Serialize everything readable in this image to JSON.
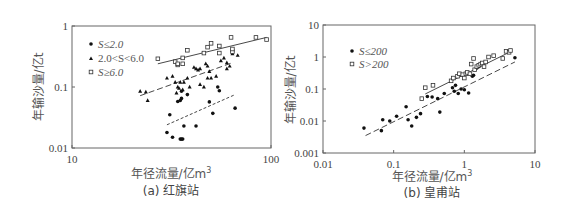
{
  "chart_data": [
    {
      "type": "scatter",
      "title": "(a) 红旗站",
      "xlabel": "年径流量/亿m³",
      "ylabel": "年输沙量/亿t",
      "xscale": "log",
      "yscale": "log",
      "xlim": [
        10,
        100
      ],
      "ylim": [
        0.01,
        1
      ],
      "xticks": [
        "10",
        "100"
      ],
      "yticks": [
        "0.01",
        "0.1",
        "1"
      ],
      "legend_position": "upper-left",
      "grid": false,
      "series": [
        {
          "name": "S≤2.0",
          "marker": "filled-circle",
          "fit_line": "dotted",
          "points": [
            [
              30,
              0.018
            ],
            [
              31,
              0.035
            ],
            [
              32,
              0.015
            ],
            [
              35,
              0.014
            ],
            [
              35.5,
              0.014
            ],
            [
              36,
              0.014
            ],
            [
              36.5,
              0.023
            ],
            [
              42,
              0.023
            ],
            [
              49,
              0.057
            ],
            [
              51,
              0.037
            ],
            [
              54,
              0.1
            ],
            [
              55,
              0.087
            ],
            [
              66,
              0.045
            ],
            [
              38,
              0.075
            ],
            [
              34,
              0.058
            ],
            [
              35,
              0.06
            ],
            [
              35.5,
              0.065
            ],
            [
              35.5,
              0.085
            ]
          ],
          "fit": [
            [
              30,
              0.024
            ],
            [
              66,
              0.075
            ]
          ]
        },
        {
          "name": "2.0<S<6.0",
          "marker": "filled-triangle",
          "fit_line": "dashed",
          "points": [
            [
              22,
              0.085
            ],
            [
              23.5,
              0.083
            ],
            [
              24,
              0.06
            ],
            [
              30,
              0.14
            ],
            [
              32,
              0.15
            ],
            [
              33,
              0.12
            ],
            [
              33.5,
              0.08
            ],
            [
              34,
              0.1
            ],
            [
              34.5,
              0.095
            ],
            [
              35,
              0.12
            ],
            [
              36,
              0.09
            ],
            [
              36.5,
              0.12
            ],
            [
              38,
              0.14
            ],
            [
              39,
              0.1
            ],
            [
              41,
              0.21
            ],
            [
              42,
              0.2
            ],
            [
              43,
              0.19
            ],
            [
              44,
              0.11
            ],
            [
              44,
              0.2
            ],
            [
              46,
              0.1
            ],
            [
              47,
              0.24
            ],
            [
              48,
              0.14
            ],
            [
              48,
              0.22
            ],
            [
              49,
              0.18
            ],
            [
              50,
              0.14
            ],
            [
              53,
              0.15
            ],
            [
              56,
              0.27
            ],
            [
              58,
              0.3
            ],
            [
              60,
              0.25
            ],
            [
              60,
              0.2
            ],
            [
              62,
              0.22
            ],
            [
              64,
              0.35
            ],
            [
              64,
              0.4
            ],
            [
              68,
              0.33
            ]
          ],
          "fit": [
            [
              22,
              0.072
            ],
            [
              64,
              0.25
            ]
          ]
        },
        {
          "name": "S≥6.0",
          "marker": "open-square",
          "fit_line": "solid",
          "points": [
            [
              27,
              0.29
            ],
            [
              33,
              0.26
            ],
            [
              34,
              0.23
            ],
            [
              34,
              0.24
            ],
            [
              36,
              0.3
            ],
            [
              36,
              0.24
            ],
            [
              38,
              0.4
            ],
            [
              46,
              0.36
            ],
            [
              48,
              0.45
            ],
            [
              50,
              0.52
            ],
            [
              55,
              0.36
            ],
            [
              55,
              0.47
            ],
            [
              63,
              0.65
            ],
            [
              64,
              0.38
            ],
            [
              64,
              0.42
            ],
            [
              84,
              0.65
            ],
            [
              95,
              0.6
            ]
          ],
          "fit": [
            [
              27,
              0.24
            ],
            [
              95,
              0.65
            ]
          ]
        }
      ]
    },
    {
      "type": "scatter",
      "title": "(b) 皇甫站",
      "xlabel": "年径流量/亿m³",
      "ylabel": "年输沙量/亿t",
      "xscale": "log",
      "yscale": "log",
      "xlim": [
        0.01,
        10
      ],
      "ylim": [
        0.001,
        10
      ],
      "xticks": [
        "0.01",
        "0.1",
        "1",
        "10"
      ],
      "yticks": [
        "0.001",
        "0.01",
        "0.1",
        "1",
        "10"
      ],
      "legend_position": "upper-left",
      "grid": false,
      "series": [
        {
          "name": "S≤200",
          "marker": "filled-circle",
          "fit_line": "dashed",
          "points": [
            [
              0.038,
              0.006
            ],
            [
              0.067,
              0.005
            ],
            [
              0.07,
              0.011
            ],
            [
              0.088,
              0.01
            ],
            [
              0.11,
              0.014
            ],
            [
              0.15,
              0.028
            ],
            [
              0.16,
              0.011
            ],
            [
              0.18,
              0.007
            ],
            [
              0.21,
              0.013
            ],
            [
              0.24,
              0.017
            ],
            [
              0.3,
              0.058
            ],
            [
              0.35,
              0.056
            ],
            [
              0.42,
              0.05
            ],
            [
              0.45,
              0.019
            ],
            [
              0.52,
              0.072
            ],
            [
              0.68,
              0.11
            ],
            [
              0.72,
              0.085
            ],
            [
              0.75,
              0.13
            ],
            [
              0.82,
              0.072
            ],
            [
              0.9,
              0.1
            ],
            [
              1.0,
              0.095
            ],
            [
              1.15,
              0.075
            ],
            [
              1.3,
              0.25
            ],
            [
              1.35,
              0.27
            ],
            [
              1.5,
              0.45
            ],
            [
              1.6,
              0.5
            ],
            [
              1.8,
              0.6
            ],
            [
              5.2,
              0.95
            ]
          ],
          "fit": [
            [
              0.04,
              0.0035
            ],
            [
              5.2,
              0.7
            ]
          ]
        },
        {
          "name": "S>200",
          "marker": "open-square",
          "fit_line": "solid",
          "points": [
            [
              0.25,
              0.05
            ],
            [
              0.28,
              0.11
            ],
            [
              0.36,
              0.13
            ],
            [
              0.65,
              0.18
            ],
            [
              0.7,
              0.22
            ],
            [
              0.8,
              0.25
            ],
            [
              0.85,
              0.3
            ],
            [
              0.95,
              0.28
            ],
            [
              1.0,
              0.22
            ],
            [
              1.05,
              0.3
            ],
            [
              1.1,
              0.33
            ],
            [
              1.2,
              0.3
            ],
            [
              1.25,
              0.6
            ],
            [
              1.35,
              0.9
            ],
            [
              1.4,
              0.4
            ],
            [
              1.5,
              0.5
            ],
            [
              1.6,
              0.55
            ],
            [
              1.7,
              0.6
            ],
            [
              1.8,
              0.65
            ],
            [
              1.9,
              0.5
            ],
            [
              2.0,
              0.7
            ],
            [
              2.2,
              1.0
            ],
            [
              2.6,
              1.1
            ],
            [
              3.5,
              0.9
            ],
            [
              3.9,
              1.5
            ],
            [
              4.3,
              1.4
            ],
            [
              4.5,
              1.6
            ]
          ],
          "fit": [
            [
              0.28,
              0.07
            ],
            [
              4.6,
              1.5
            ]
          ]
        }
      ]
    }
  ],
  "charts": {
    "a": {
      "ylabel": "年输沙量/亿t",
      "xlabel": "年径流量/亿m",
      "xlabel_sup": "3",
      "caption": "(a) 红旗站",
      "legend": [
        "S≤2.0",
        "2.0<S<6.0",
        "S≥6.0"
      ]
    },
    "b": {
      "ylabel": "年输沙量/亿t",
      "xlabel": "年径流量/亿m",
      "xlabel_sup": "3",
      "caption": "(b) 皇甫站",
      "legend": [
        "S≤200",
        "S>200"
      ]
    }
  },
  "colors": {
    "frame": "#555555",
    "marker": "#111111",
    "text": "#444444"
  }
}
